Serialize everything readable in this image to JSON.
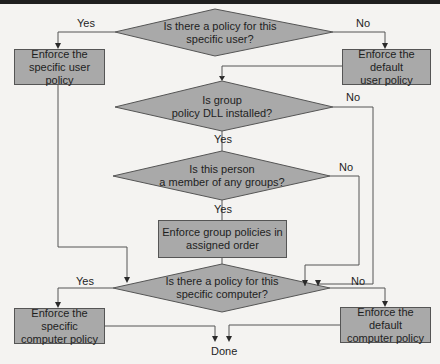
{
  "diagram": {
    "type": "flowchart",
    "decisions": [
      {
        "id": "d1",
        "line1": "Is there a policy for this",
        "line2": "specific user?"
      },
      {
        "id": "d2",
        "line1": "Is group",
        "line2": "policy DLL installed?"
      },
      {
        "id": "d3",
        "line1": "Is this person",
        "line2": "a member of any groups?"
      },
      {
        "id": "d4",
        "line1": "Is there a policy for this",
        "line2": "specific computer?"
      }
    ],
    "actions": [
      {
        "id": "a1",
        "line1": "Enforce the",
        "line2": "specific user policy"
      },
      {
        "id": "a2",
        "line1": "Enforce the default",
        "line2": "user policy"
      },
      {
        "id": "a3",
        "line1": "Enforce group policies in",
        "line2": "assigned order"
      },
      {
        "id": "a4",
        "line1": "Enforce the specific",
        "line2": "computer policy"
      },
      {
        "id": "a5",
        "line1": "Enforce the default",
        "line2": "computer policy"
      }
    ],
    "labels": {
      "d1_yes": "Yes",
      "d1_no": "No",
      "d2_yes": "Yes",
      "d2_no": "No",
      "d3_yes": "Yes",
      "d3_no": "No",
      "d4_yes": "Yes",
      "d4_no": "No",
      "end": "Done"
    },
    "colors": {
      "shape_fill": "#a9a9a9",
      "stroke": "#555555",
      "background": "#f4f3f1"
    }
  }
}
